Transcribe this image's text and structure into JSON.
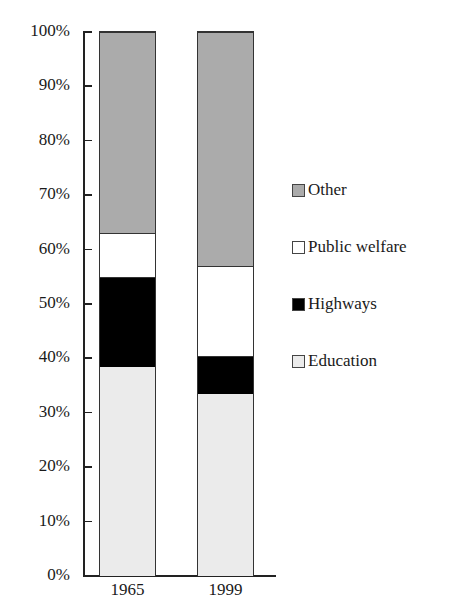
{
  "chart_data": {
    "type": "bar",
    "stacked": true,
    "normalized_percent": true,
    "title": "",
    "xlabel": "",
    "ylabel": "",
    "categories": [
      "1965",
      "1999"
    ],
    "series": [
      {
        "name": "Education",
        "color": "#ebebeb",
        "values": [
          38.5,
          33.5
        ]
      },
      {
        "name": "Highways",
        "color": "#000000",
        "values": [
          16.5,
          7
        ]
      },
      {
        "name": "Public welfare",
        "color": "#ffffff",
        "values": [
          8,
          16.5
        ]
      },
      {
        "name": "Other",
        "color": "#ababab",
        "values": [
          37,
          43
        ]
      }
    ],
    "cumulative_boundaries": {
      "1965": [
        38.5,
        55,
        63,
        100
      ],
      "1999": [
        33.5,
        40.5,
        57,
        100
      ]
    },
    "ylim": [
      0,
      100
    ],
    "yticks": [
      "0%",
      "10%",
      "20%",
      "30%",
      "40%",
      "50%",
      "60%",
      "70%",
      "80%",
      "90%",
      "100%"
    ],
    "grid": false,
    "legend_position": "right",
    "legend_order": [
      "Other",
      "Public welfare",
      "Highways",
      "Education"
    ]
  },
  "legend": [
    {
      "label": "Other",
      "color": "#ababab"
    },
    {
      "label": "Public welfare",
      "color": "#ffffff"
    },
    {
      "label": "Highways",
      "color": "#000000"
    },
    {
      "label": "Education",
      "color": "#ebebeb"
    }
  ]
}
